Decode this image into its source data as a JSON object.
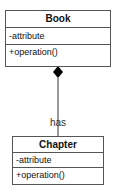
{
  "diagram": {
    "type": "UML class diagram",
    "classes": [
      {
        "name": "Book",
        "attributes": [
          "-attribute"
        ],
        "operations": [
          "+operation()"
        ]
      },
      {
        "name": "Chapter",
        "attributes": [
          "-attribute"
        ],
        "operations": [
          "+operation()"
        ]
      }
    ],
    "relationships": [
      {
        "type": "composition",
        "from": "Book",
        "to": "Chapter",
        "label": "has",
        "icon": "filled-diamond-icon"
      }
    ],
    "colors": {
      "border": "#555555",
      "line": "#333333",
      "diamond": "#000000",
      "background": "#ffffff"
    }
  }
}
